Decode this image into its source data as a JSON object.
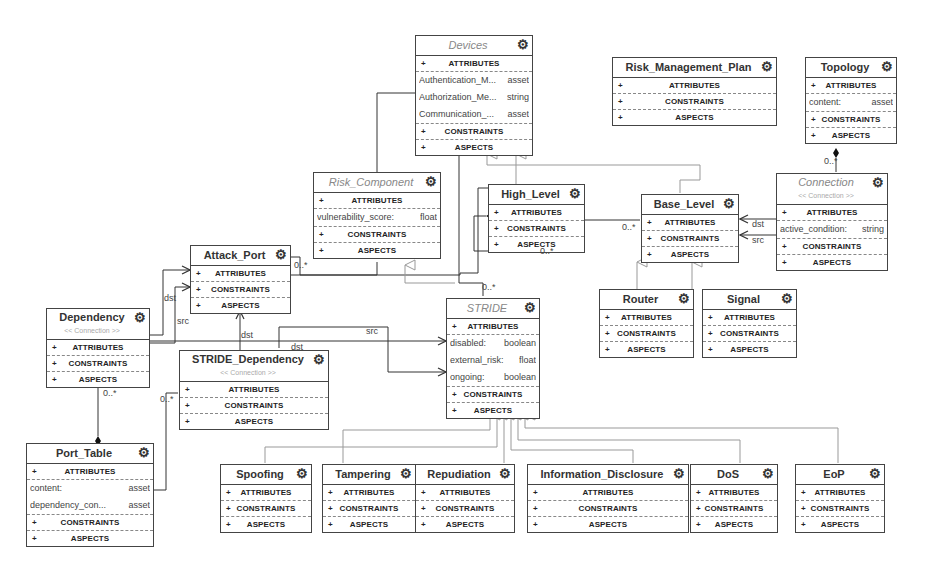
{
  "sections": {
    "attributes": "ATTRIBUTES",
    "constraints": "CONSTRAINTS",
    "aspects": "ASPECTS",
    "plus": "+"
  },
  "icons": {
    "gear": "gear-icon"
  },
  "classes": {
    "devices": {
      "name": "Devices",
      "abstract": true,
      "attributes": [
        {
          "name": "Authentication_M...",
          "type": "asset"
        },
        {
          "name": "Authorization_Me...",
          "type": "string"
        },
        {
          "name": "Communication_...",
          "type": "asset"
        }
      ]
    },
    "risk_management_plan": {
      "name": "Risk_Management_Plan"
    },
    "topology": {
      "name": "Topology",
      "attributes": [
        {
          "name": "content:",
          "type": "asset"
        }
      ]
    },
    "risk_component": {
      "name": "Risk_Component",
      "abstract": true,
      "attributes": [
        {
          "name": "vulnerability_score:",
          "type": "float"
        }
      ]
    },
    "high_level": {
      "name": "High_Level"
    },
    "base_level": {
      "name": "Base_Level"
    },
    "connection": {
      "name": "Connection",
      "abstract": true,
      "stereotype": "<< Connection >>",
      "attributes": [
        {
          "name": "active_condition:",
          "type": "string"
        }
      ]
    },
    "attack_port": {
      "name": "Attack_Port"
    },
    "router": {
      "name": "Router"
    },
    "signal": {
      "name": "Signal"
    },
    "dependency": {
      "name": "Dependency",
      "stereotype": "<< Connection >>"
    },
    "stride": {
      "name": "STRIDE",
      "abstract": true,
      "attributes": [
        {
          "name": "disabled:",
          "type": "boolean"
        },
        {
          "name": "external_risk:",
          "type": "float"
        },
        {
          "name": "ongoing:",
          "type": "boolean"
        }
      ]
    },
    "stride_dependency": {
      "name": "STRIDE_Dependency",
      "stereotype": "<< Connection >>"
    },
    "port_table": {
      "name": "Port_Table",
      "attributes": [
        {
          "name": "content:",
          "type": "asset"
        },
        {
          "name": "dependency_con...",
          "type": "asset"
        }
      ]
    },
    "spoofing": {
      "name": "Spoofing"
    },
    "tampering": {
      "name": "Tampering"
    },
    "repudiation": {
      "name": "Repudiation"
    },
    "information_disclosure": {
      "name": "Information_Disclosure"
    },
    "dos": {
      "name": "DoS"
    },
    "eop": {
      "name": "EoP"
    }
  },
  "labels": {
    "topology_conn_mult": "0..*",
    "base_high_mult": "0..*",
    "high_self_mult": "0..*",
    "conn_dst": "dst",
    "conn_src": "src",
    "attack_mult": "0..*",
    "stride_mult": "0..*",
    "dep_dst": "dst",
    "dep_src": "src",
    "sd_dst1": "dst",
    "sd_dst2": "dst",
    "sd_src": "src",
    "dep_port_mult": "0..*",
    "sd_port_mult": "0..*"
  }
}
